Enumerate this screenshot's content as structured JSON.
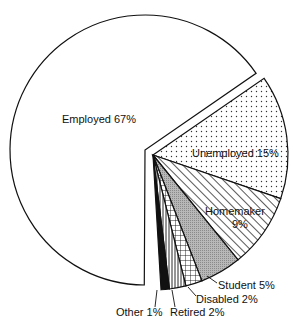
{
  "chart_data": {
    "type": "pie",
    "title": "",
    "exploded": [
      "Employed"
    ],
    "categories": [
      "Employed",
      "Unemployed",
      "Homemaker",
      "Student",
      "Disabled",
      "Retired",
      "Other"
    ],
    "values": [
      67,
      15,
      9,
      5,
      2,
      2,
      1
    ],
    "unit": "%",
    "labels": [
      {
        "name": "Employed",
        "text": "Employed 67%",
        "pattern": "none"
      },
      {
        "name": "Unemployed",
        "text": "Unemployed 15%",
        "pattern": "dots"
      },
      {
        "name": "Homemaker",
        "text": "Homemaker",
        "text2": "9%",
        "pattern": "diagonal-lines"
      },
      {
        "name": "Student",
        "text": "Student 5%",
        "pattern": "gray-stipple"
      },
      {
        "name": "Disabled",
        "text": "Disabled 2%",
        "pattern": "grid"
      },
      {
        "name": "Retired",
        "text": "Retired 2%",
        "pattern": "vertical-lines"
      },
      {
        "name": "Other",
        "text": "Other 1%",
        "pattern": "solid-black"
      }
    ],
    "legend": "none"
  }
}
